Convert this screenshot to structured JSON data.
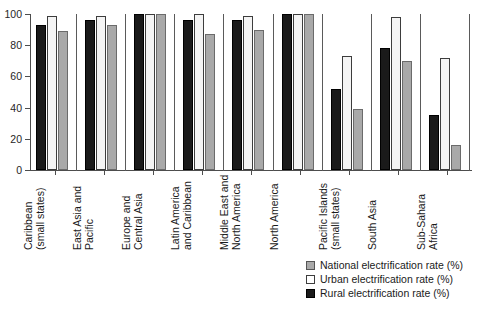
{
  "chart_data": {
    "type": "bar",
    "title": "",
    "subtitle": "",
    "xlabel": "",
    "ylabel": "",
    "ylim": [
      0,
      100
    ],
    "yticks": [
      0,
      20,
      40,
      60,
      80,
      100
    ],
    "ytick_labels": [
      "0",
      "20",
      "40",
      "60",
      "80",
      "100"
    ],
    "grid": false,
    "legend_position": "bottom-right",
    "orientation": "vertical",
    "group_separators": true,
    "categories": [
      "Caribbean (small states)",
      "East Asia and Pacific",
      "Europe and Central Asia",
      "Latin America and Caribbean",
      "Middle East and North America",
      "North America",
      "Pacific Islands (small states)",
      "South Asia",
      "Sub-Sahara Africa"
    ],
    "category_lines": [
      [
        "Caribbean",
        "(small states)"
      ],
      [
        "East Asia and",
        "Pacific"
      ],
      [
        "Europe and",
        "Central Asia"
      ],
      [
        "Latin America",
        "and Caribbean"
      ],
      [
        "Middle East and",
        "North America"
      ],
      [
        "North America"
      ],
      [
        "Pacific Islands",
        "(small states)"
      ],
      [
        "South Asia"
      ],
      [
        "Sub-Sahara",
        "Africa"
      ]
    ],
    "series": [
      {
        "name": "Rural electrification rate (%)",
        "color": "#1a1a1a",
        "draw_order": 1,
        "values": [
          93,
          96,
          100,
          96,
          96,
          100,
          52,
          78,
          35
        ]
      },
      {
        "name": "Urban electrification rate (%)",
        "color": "#ffffff",
        "draw_order": 2,
        "values": [
          99,
          99,
          100,
          100,
          99,
          100,
          73,
          98,
          72
        ]
      },
      {
        "name": "National electrification rate (%)",
        "color": "#a9a9a9",
        "draw_order": 3,
        "values": [
          89,
          93,
          100,
          87,
          90,
          100,
          39,
          70,
          16
        ]
      }
    ],
    "legend_entries": [
      {
        "label": "National electrification rate (%)",
        "swatch": "national"
      },
      {
        "label": "Urban electrification rate (%)",
        "swatch": "urban"
      },
      {
        "label": "Rural electrification rate (%)",
        "swatch": "rural"
      }
    ]
  }
}
